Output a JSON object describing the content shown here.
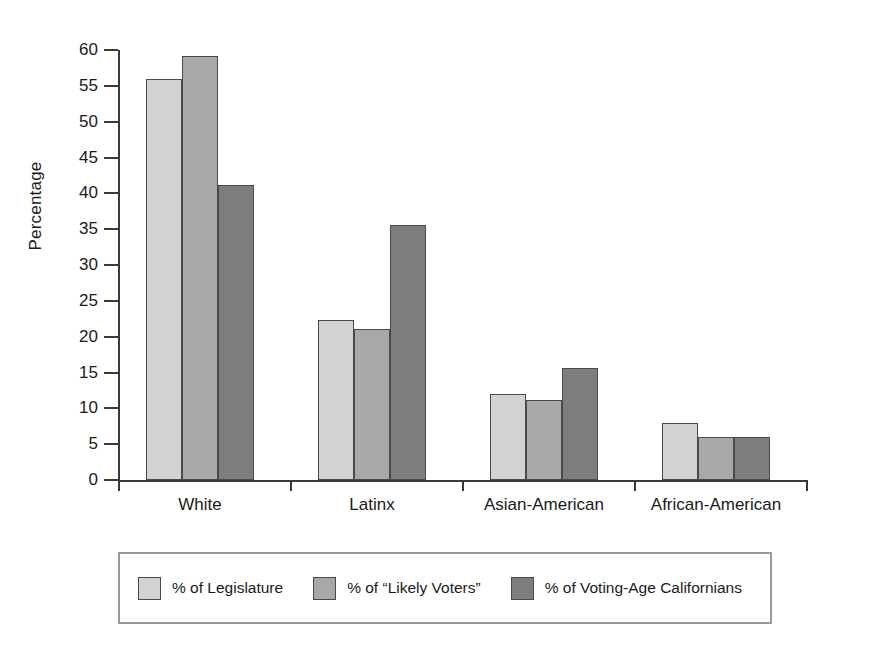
{
  "chart_data": {
    "type": "bar",
    "title": "",
    "subtitle": "",
    "xlabel": "",
    "ylabel": "Percentage",
    "ylim": [
      0,
      60
    ],
    "ytick_step": 5,
    "yticks": [
      60,
      55,
      50,
      45,
      40,
      35,
      30,
      25,
      20,
      15,
      10,
      5,
      0
    ],
    "ytick_labels": [
      "60",
      "55",
      "50",
      "45",
      "40",
      "35",
      "30",
      "25",
      "20",
      "15",
      "10",
      "5",
      "0"
    ],
    "grid": false,
    "legend_position": "bottom",
    "categories": [
      "White",
      "Latinx",
      "Asian-American",
      "African-American"
    ],
    "series": [
      {
        "name": "% of Legislature",
        "color": "#d2d2d2",
        "values": [
          56,
          22.3,
          12,
          8
        ]
      },
      {
        "name": "% of “Likely Voters”",
        "color": "#a8a8a8",
        "values": [
          59.2,
          21.1,
          11.1,
          6
        ]
      },
      {
        "name": "% of Voting-Age Californians",
        "color": "#7d7d7d",
        "values": [
          41.1,
          35.6,
          15.6,
          6
        ]
      }
    ]
  },
  "colors": {
    "axis": "#3a3a3a",
    "bar_outline": "#4a4a4a",
    "legend_border": "#9a9a9a",
    "background": "#ffffff",
    "text": "#1a1a1a"
  }
}
